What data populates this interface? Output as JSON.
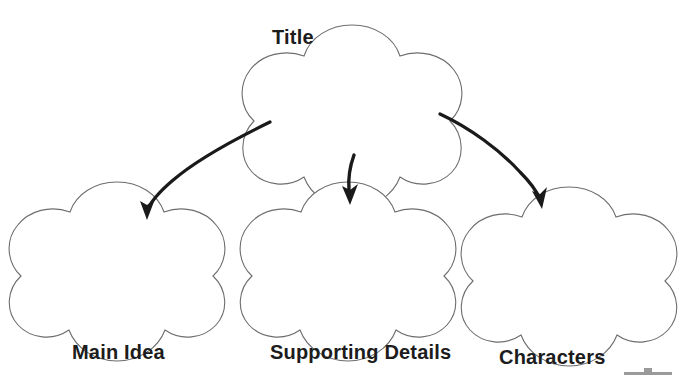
{
  "document": {
    "type": "graphic-organizer-worksheet",
    "title_text": "Title",
    "background_color": "#ffffff",
    "outline_color": "#6d6d6d",
    "arrow_color": "#1a1a1a",
    "text_color": "#1c1c1c"
  },
  "nodes": {
    "root": {
      "label": "Title",
      "shape": "five-lobed-flower",
      "label_position": "top-left-outside"
    },
    "children": [
      {
        "label": "Main Idea",
        "shape": "five-lobed-flower",
        "label_position": "below"
      },
      {
        "label": "Supporting Details",
        "shape": "five-lobed-flower",
        "label_position": "below"
      },
      {
        "label": "Characters",
        "shape": "five-lobed-flower",
        "label_position": "below"
      }
    ]
  },
  "connectors": [
    {
      "name": "arrow-to-main-idea",
      "from": "Title",
      "to": "Main Idea",
      "style": "curved-arrow"
    },
    {
      "name": "arrow-to-supporting-details",
      "from": "Title",
      "to": "Supporting Details",
      "style": "curved-arrow"
    },
    {
      "name": "arrow-to-characters",
      "from": "Title",
      "to": "Characters",
      "style": "curved-arrow"
    }
  ],
  "artifact": {
    "name": "scan-artifact",
    "color": "#9a9a9a"
  }
}
